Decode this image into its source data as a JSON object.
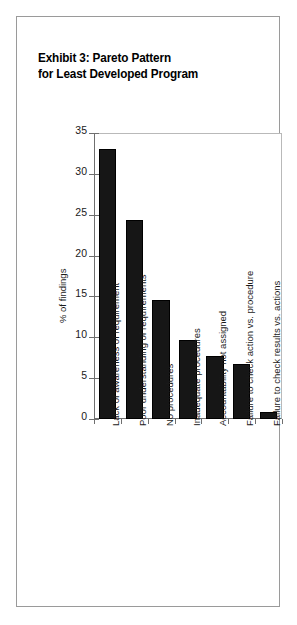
{
  "figure": {
    "title_line1": "Exhibit 3: Pareto Pattern",
    "title_line2": "for Least Developed Program",
    "border_color": "#9a9a9a",
    "background_color": "#ffffff",
    "bar_color": "#161616",
    "axis_color": "#6f6f6f"
  },
  "chart_data": {
    "type": "bar",
    "title": "Exhibit 3: Pareto Pattern for Least Developed Program",
    "xlabel": "",
    "ylabel": "% of findings",
    "ylim": [
      0,
      35
    ],
    "yticks": [
      0,
      5,
      10,
      15,
      20,
      25,
      30,
      35
    ],
    "ytick_labels": [
      "0",
      "5",
      "10",
      "15",
      "20",
      "25",
      "30",
      "35"
    ],
    "grid": false,
    "legend": false,
    "categories": [
      "Lack of awareness of requirement",
      "Poor understanding of requirements",
      "No procedures",
      "Inadequate procedures",
      "Accountability not assigned",
      "Failure to check action vs. procedure",
      "Failure to check results vs. actions"
    ],
    "values": [
      33.0,
      24.3,
      14.6,
      9.7,
      7.7,
      6.7,
      0.9
    ],
    "series": [
      {
        "name": "% of findings",
        "values": [
          33.0,
          24.3,
          14.6,
          9.7,
          7.7,
          6.7,
          0.9
        ]
      }
    ]
  }
}
